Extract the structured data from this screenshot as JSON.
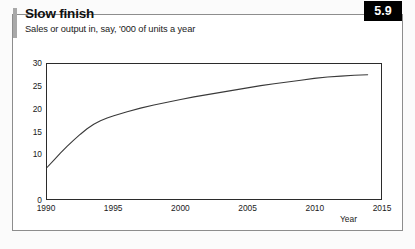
{
  "figure": {
    "title": "Slow finish",
    "subtitle": "Sales or output in, say, '000 of units a year",
    "badge": "5.9"
  },
  "chart_data": {
    "type": "line",
    "title": "Slow finish",
    "subtitle": "Sales or output in, say, '000 of units a year",
    "xlabel": "Year",
    "ylabel": "",
    "xlim": [
      1990,
      2015
    ],
    "ylim": [
      0,
      30
    ],
    "grid": false,
    "legend": null,
    "line_color": "#3a3a3a",
    "xticks": [
      1990,
      1995,
      2000,
      2005,
      2010,
      2015
    ],
    "xticklabels": [
      "1990",
      "1995",
      "2000",
      "2005",
      "2010",
      "2015"
    ],
    "yticks": [
      0,
      10,
      15,
      20,
      25,
      30
    ],
    "yticklabels": [
      "0",
      "10",
      "15",
      "20",
      "25",
      "30"
    ],
    "series": [
      {
        "name": "Sales or output",
        "x": [
          1990.0,
          1990.5,
          1991.0,
          1991.5,
          1992.0,
          1992.5,
          1993.0,
          1993.5,
          1994.0,
          1994.5,
          1995.0,
          1996.0,
          1997.0,
          1998.0,
          1999.0,
          2000.0,
          2001.0,
          2002.0,
          2003.0,
          2004.0,
          2005.0,
          2006.0,
          2007.0,
          2008.0,
          2009.0,
          2010.0,
          2011.0,
          2012.0,
          2013.0,
          2014.0
        ],
        "y": [
          7.0,
          8.6,
          10.2,
          11.7,
          13.1,
          14.4,
          15.6,
          16.6,
          17.4,
          18.0,
          18.5,
          19.4,
          20.2,
          20.9,
          21.5,
          22.1,
          22.7,
          23.2,
          23.7,
          24.2,
          24.7,
          25.2,
          25.6,
          26.0,
          26.4,
          26.8,
          27.1,
          27.3,
          27.5,
          27.6
        ]
      }
    ]
  }
}
